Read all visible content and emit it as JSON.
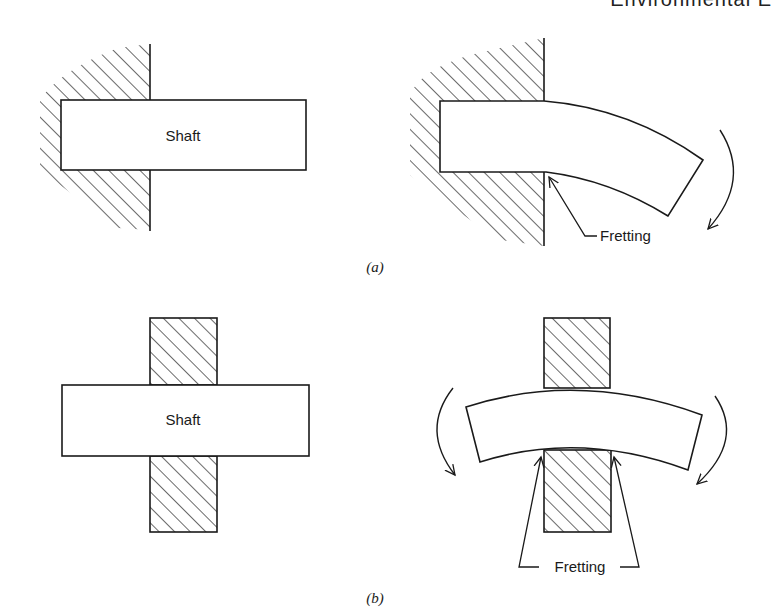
{
  "header": {
    "text": "Environmental E"
  },
  "panel_a": {
    "caption": "(a)",
    "left": {
      "shaft_label": "Shaft",
      "state": "unloaded cantilever shaft in fixed wall"
    },
    "right": {
      "fretting_label": "Fretting",
      "state": "bent cantilever shaft with moment arrow"
    }
  },
  "panel_b": {
    "caption": "(b)",
    "left": {
      "shaft_label": "Shaft",
      "state": "unloaded shaft through clamping blocks"
    },
    "right": {
      "fretting_label": "Fretting",
      "state": "bent shaft with moments at both ends"
    }
  },
  "colors": {
    "line": "#1a1a1a",
    "background": "#ffffff"
  }
}
